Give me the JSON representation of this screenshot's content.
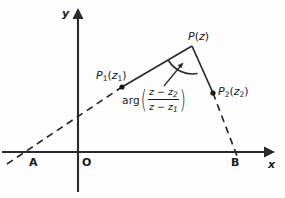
{
  "figure": {
    "type": "complex-plane-diagram",
    "axes": {
      "x_label": "x",
      "y_label": "y",
      "origin_label": "O"
    },
    "nodes": [
      {
        "id": "A",
        "label": "A"
      },
      {
        "id": "B",
        "label": "B"
      }
    ],
    "points": [
      {
        "id": "P1",
        "name": "P",
        "subscript": "1",
        "arg_open": "(",
        "arg_var": "z",
        "arg_sub": "1",
        "arg_close": ")"
      },
      {
        "id": "P",
        "name": "P",
        "subscript": "",
        "arg_open": "(",
        "arg_var": "z",
        "arg_sub": "",
        "arg_close": ")"
      },
      {
        "id": "P2",
        "name": "P",
        "subscript": "2",
        "arg_open": "(",
        "arg_var": "z",
        "arg_sub": "2",
        "arg_close": ")"
      }
    ],
    "angle_expression": {
      "function": "arg",
      "open_paren": "(",
      "numerator": "z − z",
      "numerator_sub": "2",
      "denominator": "z − z",
      "denominator_sub": "1",
      "close_paren": ")"
    },
    "colors": {
      "stroke": "#2a2a2a",
      "background": "#fdfdfd"
    }
  }
}
